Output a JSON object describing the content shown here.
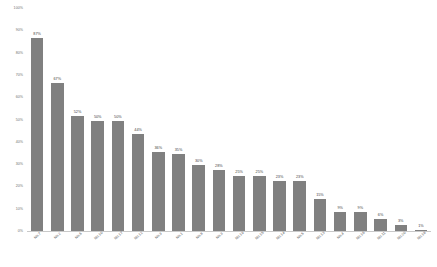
{
  "chart_data": {
    "type": "bar",
    "title": "",
    "subtitle": "",
    "xlabel": "",
    "ylabel": "",
    "ylim": [
      0,
      100
    ],
    "y_unit": "%",
    "grid": false,
    "legend": "none",
    "orientation": "vertical",
    "sort": "descending",
    "bar_color": "#808080",
    "background_color": "#ffffff",
    "axis_color": "#c9c9c9",
    "label_color": "#6f6f6f",
    "value_label_color": "#3f3f3f",
    "y_ticks": [
      "100%",
      "90%",
      "80%",
      "70%",
      "60%",
      "50%",
      "40%",
      "30%",
      "20%",
      "10%",
      "0%"
    ],
    "y_tick_values": [
      100,
      90,
      80,
      70,
      60,
      50,
      40,
      30,
      20,
      10,
      0
    ],
    "categories": [
      "No.7",
      "No.2",
      "No.6",
      "No.10",
      "No.17",
      "No.12",
      "No.9",
      "No.1",
      "No.8",
      "No.3",
      "No.19",
      "No.15",
      "No.14",
      "No.5",
      "No.13",
      "No.4",
      "No.16",
      "No.11",
      "No.20",
      "No.18"
    ],
    "values": [
      87,
      67,
      52,
      50,
      50,
      44,
      36,
      35,
      30,
      28,
      25,
      25,
      23,
      23,
      15,
      9,
      9,
      6,
      3,
      1
    ],
    "value_labels": [
      "87%",
      "67%",
      "52%",
      "50%",
      "50%",
      "44%",
      "36%",
      "35%",
      "30%",
      "28%",
      "25%",
      "25%",
      "23%",
      "23%",
      "15%",
      "9%",
      "9%",
      "6%",
      "3%",
      "1%"
    ]
  }
}
